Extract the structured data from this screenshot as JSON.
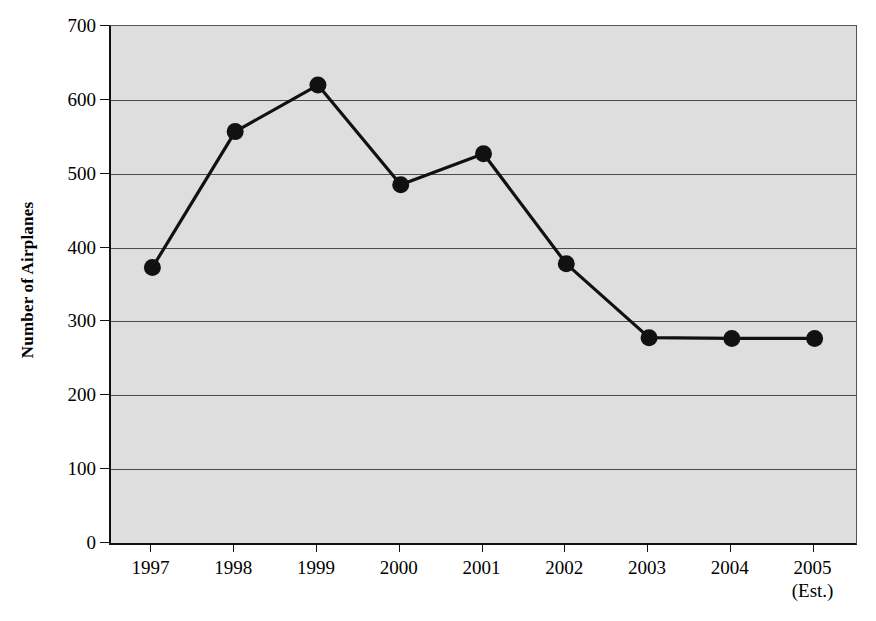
{
  "chart_data": {
    "type": "line",
    "title": "",
    "xlabel": "",
    "ylabel": "Number of Airplanes",
    "categories": [
      "1997",
      "1998",
      "1999",
      "2000",
      "2001",
      "2002",
      "2003",
      "2004",
      "2005"
    ],
    "category_sublabels": [
      "",
      "",
      "",
      "",
      "",
      "",
      "",
      "",
      "(Est.)"
    ],
    "values": [
      373,
      557,
      620,
      485,
      527,
      378,
      278,
      277,
      277
    ],
    "series": [
      {
        "name": "Number of Airplanes",
        "values": [
          373,
          557,
          620,
          485,
          527,
          378,
          278,
          277,
          277
        ]
      }
    ],
    "ylim": [
      0,
      700
    ],
    "ytick_values": [
      0,
      100,
      200,
      300,
      400,
      500,
      600,
      700
    ],
    "ytick_labels": [
      "0",
      "100",
      "200",
      "300",
      "400",
      "500",
      "600",
      "700"
    ],
    "grid": true,
    "grid_axis": "y",
    "legend": false,
    "marker": "filled-circle",
    "line_color": "#111111",
    "marker_color": "#111111",
    "plot_background": "#dedede",
    "gridline_color": "#4a4a4a",
    "axis_color": "#111111"
  },
  "axes": {
    "y_title": "Number of Airplanes"
  }
}
